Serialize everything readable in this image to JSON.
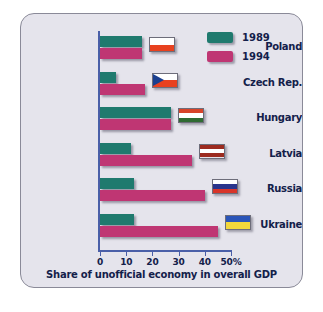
{
  "chart_data": {
    "type": "bar",
    "orientation": "horizontal",
    "title": "",
    "xlabel": "Share of unofficial economy in overall GDP",
    "ylabel": "",
    "xlim": [
      0,
      50
    ],
    "xticks": [
      {
        "value": 0,
        "label": "0"
      },
      {
        "value": 10,
        "label": "10"
      },
      {
        "value": 20,
        "label": "20"
      },
      {
        "value": 30,
        "label": "30"
      },
      {
        "value": 40,
        "label": "40"
      },
      {
        "value": 50,
        "label": "50%"
      }
    ],
    "grid": false,
    "legend_position": "top-right",
    "categories": [
      "Poland",
      "Czech Rep.",
      "Hungary",
      "Latvia",
      "Russia",
      "Ukraine"
    ],
    "series": [
      {
        "name": "1989",
        "color": "#1f7a6e",
        "values": [
          16,
          6,
          27,
          12,
          13,
          13
        ]
      },
      {
        "name": "1994",
        "color": "#bf3673",
        "values": [
          16,
          17,
          27,
          35,
          40,
          45
        ]
      }
    ]
  },
  "legend": {
    "items": [
      {
        "label": "1989",
        "color": "#1f7a6e"
      },
      {
        "label": "1994",
        "color": "#bf3673"
      }
    ]
  },
  "axis": {
    "x_title": "Share of unofficial economy in overall GDP",
    "tick_labels": [
      "0",
      "10",
      "20",
      "30",
      "40",
      "50%"
    ]
  },
  "categories": [
    {
      "label": "Poland",
      "flag": "flag-poland"
    },
    {
      "label": "Czech Rep.",
      "flag": "flag-czech"
    },
    {
      "label": "Hungary",
      "flag": "flag-hungary"
    },
    {
      "label": "Latvia",
      "flag": "flag-latvia"
    },
    {
      "label": "Russia",
      "flag": "flag-russia"
    },
    {
      "label": "Ukraine",
      "flag": "flag-ukraine"
    }
  ],
  "colors": {
    "background": "#e5e4ec",
    "axis": "#4a5fa8",
    "text": "#13204a",
    "series_1989": "#1f7a6e",
    "series_1994": "#bf3673"
  }
}
